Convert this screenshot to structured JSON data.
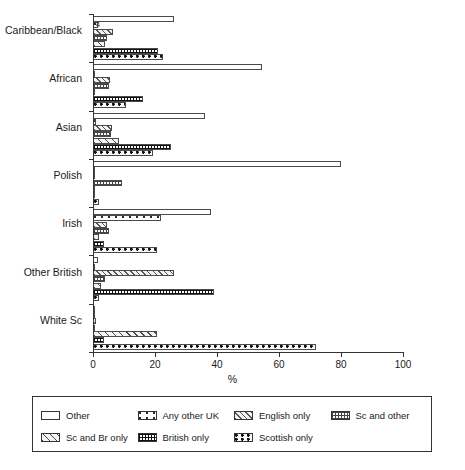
{
  "chart_data": {
    "type": "bar",
    "orientation": "horizontal",
    "title": "",
    "xlabel": "%",
    "ylabel": "",
    "xlim": [
      0,
      100
    ],
    "xticks": [
      0,
      20,
      40,
      60,
      80,
      100
    ],
    "grid": false,
    "legend_position": "bottom",
    "categories": [
      "Caribbean/Black",
      "African",
      "Asian",
      "Polish",
      "Irish",
      "Other British",
      "White Sc"
    ],
    "series": [
      {
        "name": "Other",
        "pattern": "p-other",
        "values": [
          26.0,
          54.5,
          36.0,
          80.0,
          38.0,
          1.5,
          0.3
        ]
      },
      {
        "name": "Any other UK",
        "pattern": "p-anyotheruk",
        "values": [
          1.5,
          0.6,
          0.9,
          0.2,
          22.0,
          0.6,
          0.4
        ]
      },
      {
        "name": "English only",
        "pattern": "p-englishonly",
        "values": [
          6.5,
          5.5,
          6.0,
          0.0,
          4.5,
          26.0,
          1.0
        ]
      },
      {
        "name": "Sc and other",
        "pattern": "p-scandother",
        "values": [
          4.5,
          5.0,
          5.8,
          9.5,
          5.0,
          3.8,
          0.8
        ]
      },
      {
        "name": "Sc and Br only",
        "pattern": "p-scandbronly",
        "values": [
          4.0,
          0.8,
          8.5,
          0.0,
          2.0,
          2.5,
          20.5
        ]
      },
      {
        "name": "British only",
        "pattern": "p-britishonly",
        "values": [
          21.0,
          16.0,
          25.0,
          0.4,
          3.5,
          39.0,
          3.5
        ]
      },
      {
        "name": "Scottish only",
        "pattern": "p-scottishonly",
        "values": [
          22.5,
          10.5,
          19.5,
          2.0,
          20.5,
          2.0,
          72.0
        ]
      }
    ]
  },
  "annotations": {
    "caribbean_small_marker": "4"
  },
  "legend": {
    "entries": [
      {
        "label": "Other"
      },
      {
        "label": "Any other UK"
      },
      {
        "label": "English only"
      },
      {
        "label": "Sc and other"
      },
      {
        "label": "Sc and Br only"
      },
      {
        "label": "British only"
      },
      {
        "label": "Scottish only"
      }
    ]
  },
  "axis": {
    "x_title": "%",
    "tick_labels": [
      "0",
      "20",
      "40",
      "60",
      "80",
      "100"
    ]
  }
}
